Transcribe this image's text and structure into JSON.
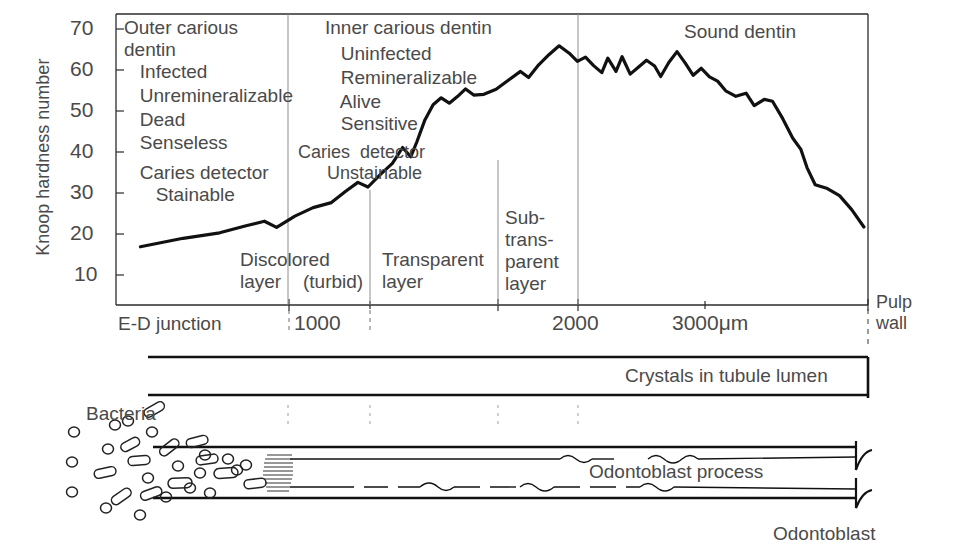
{
  "figure": {
    "type": "line-diagram"
  },
  "axes": {
    "ylabel": "Knoop hardness number",
    "yticks": [
      70,
      60,
      50,
      40,
      30,
      20,
      10
    ],
    "ylim": [
      0,
      75
    ],
    "xticks": [
      {
        "label": "E-D junction",
        "value": 0
      },
      {
        "label": "1000",
        "value": 1000
      },
      {
        "label": "2000",
        "value": 2000
      },
      {
        "label": "3000μm",
        "value": 3000
      }
    ],
    "xlim": [
      0,
      3700
    ],
    "x_end_label_line1": "Pulp",
    "x_end_label_line2": "wall",
    "grid": false
  },
  "zones": [
    {
      "name": "outer-carious-dentin",
      "lines": [
        "Outer carious",
        "dentin",
        "   Infected",
        "   Unremineralizable",
        "   Dead",
        "   Senseless"
      ],
      "detector_line1": "   Caries detector",
      "detector_line2": "      Stainable"
    },
    {
      "name": "inner-carious-dentin",
      "lines": [
        "Inner carious dentin",
        "   Uninfected",
        "   Remineralizable",
        "   Alive",
        "   Sensitive"
      ],
      "detector_line1": "Caries  detector",
      "detector_line2": "   Unstainable"
    },
    {
      "name": "sound-dentin",
      "lines": [
        "Sound dentin"
      ]
    }
  ],
  "layer_labels": {
    "discolored_l1": "Discolored",
    "discolored_l2": "layer",
    "turbid": "(turbid)",
    "transparent_l1": "Transparent",
    "transparent_l2": "layer",
    "subtransparent_l1": "Sub-",
    "subtransparent_l2": "trans-",
    "subtransparent_l3": "parent",
    "subtransparent_l4": "layer"
  },
  "diagram_labels": {
    "crystals": "Crystals in tubule lumen",
    "bacteria": "Bacteria",
    "odontoblast_process": "Odontoblast process",
    "odontoblast": "Odontoblast"
  },
  "chart_data": {
    "type": "line",
    "xlabel": "Distance from enamel-dentin junction (μm)",
    "ylabel": "Knoop hardness number",
    "xlim": [
      0,
      3700
    ],
    "ylim": [
      0,
      75
    ],
    "grid": false,
    "series": [
      {
        "name": "Knoop hardness",
        "points": [
          [
            120,
            15.0
          ],
          [
            330,
            17.2
          ],
          [
            510,
            18.6
          ],
          [
            640,
            20.4
          ],
          [
            730,
            21.6
          ],
          [
            790,
            20.0
          ],
          [
            880,
            22.9
          ],
          [
            970,
            25.1
          ],
          [
            1060,
            26.4
          ],
          [
            1130,
            29.3
          ],
          [
            1190,
            31.6
          ],
          [
            1240,
            30.4
          ],
          [
            1300,
            33.6
          ],
          [
            1360,
            36.5
          ],
          [
            1410,
            40.6
          ],
          [
            1450,
            38.2
          ],
          [
            1480,
            42.0
          ],
          [
            1520,
            47.7
          ],
          [
            1560,
            51.6
          ],
          [
            1600,
            53.4
          ],
          [
            1640,
            52.0
          ],
          [
            1680,
            53.7
          ],
          [
            1720,
            55.7
          ],
          [
            1760,
            54.1
          ],
          [
            1810,
            54.3
          ],
          [
            1870,
            55.6
          ],
          [
            1930,
            57.9
          ],
          [
            1990,
            60.2
          ],
          [
            2030,
            58.6
          ],
          [
            2080,
            61.9
          ],
          [
            2130,
            64.5
          ],
          [
            2180,
            66.8
          ],
          [
            2230,
            64.9
          ],
          [
            2270,
            62.8
          ],
          [
            2310,
            63.9
          ],
          [
            2350,
            61.7
          ],
          [
            2390,
            59.9
          ],
          [
            2420,
            63.6
          ],
          [
            2460,
            60.2
          ],
          [
            2490,
            64.0
          ],
          [
            2530,
            59.5
          ],
          [
            2570,
            61.3
          ],
          [
            2610,
            63.1
          ],
          [
            2650,
            61.6
          ],
          [
            2680,
            58.9
          ],
          [
            2720,
            62.5
          ],
          [
            2760,
            65.3
          ],
          [
            2800,
            62.4
          ],
          [
            2840,
            59.2
          ],
          [
            2880,
            61.0
          ],
          [
            2920,
            58.8
          ],
          [
            2960,
            57.7
          ],
          [
            3000,
            55.2
          ],
          [
            3050,
            53.8
          ],
          [
            3100,
            54.6
          ],
          [
            3140,
            51.4
          ],
          [
            3190,
            53.0
          ],
          [
            3230,
            52.5
          ],
          [
            3280,
            48.1
          ],
          [
            3330,
            43.0
          ],
          [
            3370,
            40.1
          ],
          [
            3400,
            35.4
          ],
          [
            3440,
            31.0
          ],
          [
            3500,
            30.0
          ],
          [
            3560,
            28.2
          ],
          [
            3620,
            24.6
          ],
          [
            3680,
            20.1
          ]
        ]
      }
    ]
  }
}
